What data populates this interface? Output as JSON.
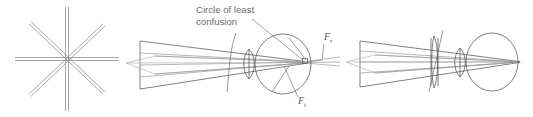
{
  "figure": {
    "name": "astigmatism-optical-diagram",
    "background_color": "#ffffff",
    "ink_color": "#4a4a4a",
    "label_color": "#6b6b6b"
  },
  "panels": [
    {
      "id": "starburst-panel",
      "name": "starburst-test-pattern",
      "description": "Radial starburst / asterisk test target with eight rays",
      "ray_count": 8,
      "line_pairs": 4,
      "center_x": 67,
      "center_y": 59,
      "ray_length": 52,
      "pair_gap": 3,
      "angles_deg": [
        0,
        45,
        90,
        135
      ],
      "color": "#8f8f8f"
    },
    {
      "id": "uncorrected-eye-panel",
      "name": "astigmatic-eye-uncorrected",
      "description": "Astigmatic eye: tangential and radial focal lines separated, circle of least confusion on retina",
      "callout": {
        "line1": "Circle of least",
        "line2": "confusion",
        "text_x": 196,
        "text_y": 13,
        "leader_from_x": 252,
        "leader_from_y": 18,
        "leader_to_x": 303,
        "leader_to_y": 62
      },
      "focus_labels": [
        {
          "name": "radial-focus-label",
          "symbol": "F",
          "subscript": "r",
          "x": 326,
          "y": 40,
          "leader_from_x": 324,
          "leader_from_y": 43,
          "leader_to_x": 318,
          "leader_to_y": 64
        },
        {
          "name": "tangential-focus-label",
          "symbol": "F",
          "subscript": "t",
          "x": 301,
          "y": 104,
          "leader_from_x": 300,
          "leader_from_y": 97,
          "leader_to_x": 284,
          "leader_to_y": 66
        }
      ],
      "eye": {
        "cx": 283,
        "cy": 64,
        "rx": 28,
        "ry": 30
      },
      "crystalline_lens": {
        "cx": 249,
        "cy": 64,
        "rx": 5.5,
        "ry": 15
      },
      "retina_spot": {
        "x": 305,
        "y": 61,
        "size": 5
      },
      "beam_origin_x": 140,
      "has_corrective_lens": false
    },
    {
      "id": "corrected-eye-panel",
      "name": "astigmatic-eye-corrected",
      "description": "Same eye with cylindrical corrective lens; rays converge to a single point focus on the retina",
      "eye": {
        "cx": 492,
        "cy": 62,
        "rx": 26,
        "ry": 29
      },
      "crystalline_lens": {
        "cx": 460,
        "cy": 62,
        "rx": 5.5,
        "ry": 14
      },
      "corrective_lens": {
        "cx": 437,
        "cy": 62,
        "rx": 3,
        "ry": 24
      },
      "focus_point": {
        "x": 519,
        "y": 62
      },
      "beam_origin_x": 360,
      "has_corrective_lens": true
    }
  ],
  "accessibility": {
    "title": "Astigmatism: starburst target, uncorrected astigmatic eye, and cylindrically corrected eye"
  }
}
